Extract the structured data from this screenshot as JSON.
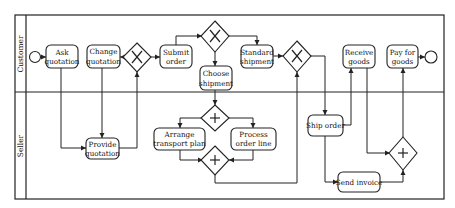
{
  "diagram": {
    "type": "bpmn-swimlane",
    "lanes": [
      {
        "id": "customer",
        "label": "Customer"
      },
      {
        "id": "seller",
        "label": "Seller"
      }
    ],
    "tasks": {
      "ask_quotation": {
        "line1": "Ask",
        "line2": "quotation",
        "lane": "customer"
      },
      "change_quotation": {
        "line1": "Change",
        "line2": "quotation",
        "lane": "customer"
      },
      "submit_order": {
        "line1": "Submit",
        "line2": "order",
        "lane": "customer"
      },
      "choose_shipment": {
        "line1": "Choose",
        "line2": "shipment",
        "lane": "customer"
      },
      "standard_shipment": {
        "line1": "Standard",
        "line2": "shipment",
        "lane": "customer"
      },
      "receive_goods": {
        "line1": "Receive",
        "line2": "goods",
        "lane": "customer"
      },
      "pay_for_goods": {
        "line1": "Pay for",
        "line2": "goods",
        "lane": "customer"
      },
      "provide_quotation": {
        "line1": "Provide",
        "line2": "quotation",
        "lane": "seller"
      },
      "arrange_transport_plan": {
        "line1": "Arrange",
        "line2": "transport plan",
        "lane": "seller"
      },
      "process_order_line": {
        "line1": "Process",
        "line2": "order line",
        "lane": "seller"
      },
      "ship_order": {
        "line1": "Ship order",
        "lane": "seller"
      },
      "send_invoice": {
        "line1": "Send invoice",
        "lane": "seller"
      }
    },
    "gateways": [
      {
        "id": "gw_quote",
        "kind": "exclusive",
        "symbol": "X"
      },
      {
        "id": "gw_shipment_choice",
        "kind": "exclusive",
        "symbol": "X"
      },
      {
        "id": "gw_shipment_merge",
        "kind": "exclusive",
        "symbol": "X"
      },
      {
        "id": "gw_split",
        "kind": "parallel",
        "symbol": "+"
      },
      {
        "id": "gw_join",
        "kind": "parallel",
        "symbol": "+"
      },
      {
        "id": "gw_final",
        "kind": "parallel",
        "symbol": "+"
      }
    ],
    "events": [
      {
        "id": "start",
        "kind": "start"
      },
      {
        "id": "end",
        "kind": "end"
      }
    ]
  }
}
